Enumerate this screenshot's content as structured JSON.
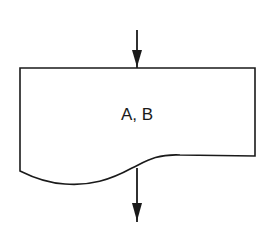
{
  "diagram": {
    "type": "flowchart",
    "shape": "document",
    "label": "A, B",
    "colors": {
      "stroke": "#1a1a1a",
      "background": "#ffffff"
    },
    "arrows": [
      {
        "name": "incoming-arrow",
        "direction": "down",
        "position": "top"
      },
      {
        "name": "outgoing-arrow",
        "direction": "down",
        "position": "bottom"
      }
    ]
  }
}
